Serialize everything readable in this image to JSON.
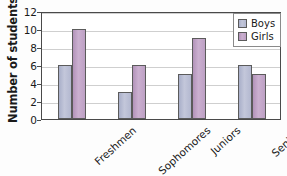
{
  "chart_data": {
    "type": "bar",
    "title": "",
    "xlabel": "",
    "ylabel": "Number of students",
    "categories": [
      "Freshmen",
      "Sophomores",
      "Juniors",
      "Seniors"
    ],
    "series": [
      {
        "name": "Boys",
        "values": [
          6,
          3,
          5,
          6
        ],
        "color": "#b8bdd4"
      },
      {
        "name": "Girls",
        "values": [
          10,
          6,
          9,
          5
        ],
        "color": "#c0a2c6"
      }
    ],
    "ylim": [
      0,
      12
    ],
    "y_ticks": [
      0,
      2,
      4,
      6,
      8,
      10,
      12
    ],
    "y_tick_labels": [
      "0",
      "2",
      "4",
      "6",
      "8",
      "10",
      "12"
    ],
    "grid": true,
    "grid_axis": "y",
    "legend_position": "top-right",
    "x_tick_rotation": -42
  },
  "legend": {
    "entries": [
      {
        "label": "Boys"
      },
      {
        "label": "Girls"
      }
    ]
  },
  "axis": {
    "y_title": "Number of students"
  }
}
